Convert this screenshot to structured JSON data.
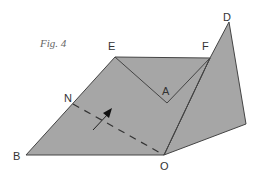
{
  "figure": {
    "caption": "Fig. 4",
    "fill_color": "#a6a6a6",
    "stroke_color": "#444444",
    "labels": {
      "E": "E",
      "F": "F",
      "D": "D",
      "A": "A",
      "N": "N",
      "B": "B",
      "O": "O"
    },
    "fold_line": "dashed line from N to O",
    "arrow": "arrow indicating fold direction"
  }
}
